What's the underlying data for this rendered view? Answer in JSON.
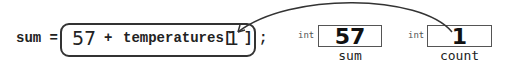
{
  "statement": {
    "lhs": "sum =",
    "expression": {
      "literal": "57",
      "operator": "+",
      "array_name": "temperatures[",
      "index_value": "1",
      "close_bracket": "]"
    },
    "terminator": ";"
  },
  "variables": [
    {
      "type": "int",
      "value": "57",
      "name": "sum"
    },
    {
      "type": "int",
      "value": "1",
      "name": "count"
    }
  ],
  "arrow": {
    "from": "count",
    "to": "expression.index_value"
  },
  "colors": {
    "stroke": "#333333",
    "text": "#222222"
  }
}
